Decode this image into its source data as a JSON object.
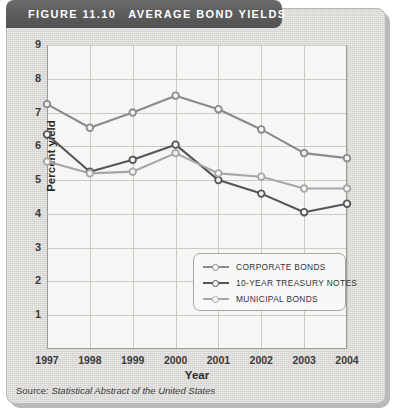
{
  "header": {
    "figure_number": "FIGURE 11.10",
    "title": "AVERAGE BOND YIELDS"
  },
  "source": {
    "prefix": "Source: ",
    "title": "Statistical Abstract of the United States"
  },
  "axes": {
    "ylabel": "Percent yield",
    "xlabel": "Year",
    "yticks": [
      "9",
      "8",
      "7",
      "6",
      "5",
      "4",
      "3",
      "2",
      "1"
    ],
    "xticks": [
      "1997",
      "1998",
      "1999",
      "2000",
      "2001",
      "2002",
      "2003",
      "2004"
    ]
  },
  "legend": {
    "items": [
      {
        "label": "CORPORATE BONDS",
        "color": "#8a8a8a"
      },
      {
        "label": "10-YEAR TREASURY NOTES",
        "color": "#555555"
      },
      {
        "label": "MUNICIPAL BONDS",
        "color": "#a6a6a6"
      }
    ]
  },
  "chart_data": {
    "type": "line",
    "title": "AVERAGE BOND YIELDS",
    "xlabel": "Year",
    "ylabel": "Percent yield",
    "categories": [
      "1997",
      "1998",
      "1999",
      "2000",
      "2001",
      "2002",
      "2003",
      "2004"
    ],
    "ylim": [
      0,
      9
    ],
    "yticks": [
      1,
      2,
      3,
      4,
      5,
      6,
      7,
      8,
      9
    ],
    "grid": true,
    "legend_position": "inside-lower-right",
    "series": [
      {
        "name": "CORPORATE BONDS",
        "color": "#8a8a8a",
        "values": [
          7.25,
          6.55,
          7.0,
          7.5,
          7.1,
          6.5,
          5.8,
          5.65
        ]
      },
      {
        "name": "10-YEAR TREASURY NOTES",
        "color": "#555555",
        "values": [
          6.35,
          5.25,
          5.6,
          6.05,
          5.0,
          4.6,
          4.05,
          4.3
        ]
      },
      {
        "name": "MUNICIPAL BONDS",
        "color": "#a6a6a6",
        "values": [
          5.55,
          5.2,
          5.25,
          5.8,
          5.2,
          5.1,
          4.75,
          4.75
        ]
      }
    ]
  }
}
